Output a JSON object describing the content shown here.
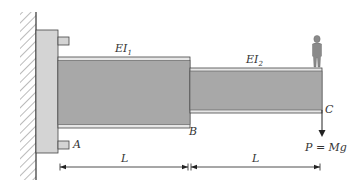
{
  "diagram": {
    "type": "stepped cantilever beam",
    "colors": {
      "wall_line": "#333333",
      "hatch": "#555555",
      "support_plate": "#d4d4d4",
      "beam_fill": "#a8a8a8",
      "flange_fill": "#e6e6e6",
      "outline": "#444444",
      "person": "#8a8a8a"
    },
    "segments": [
      {
        "id": "segment-1",
        "stiffness_label": "EI",
        "stiffness_sub": "1",
        "length_label": "L"
      },
      {
        "id": "segment-2",
        "stiffness_label": "EI",
        "stiffness_sub": "2",
        "length_label": "L"
      }
    ],
    "points": {
      "A": "A",
      "B": "B",
      "C": "C"
    },
    "load": {
      "label": "P = Mg"
    }
  }
}
